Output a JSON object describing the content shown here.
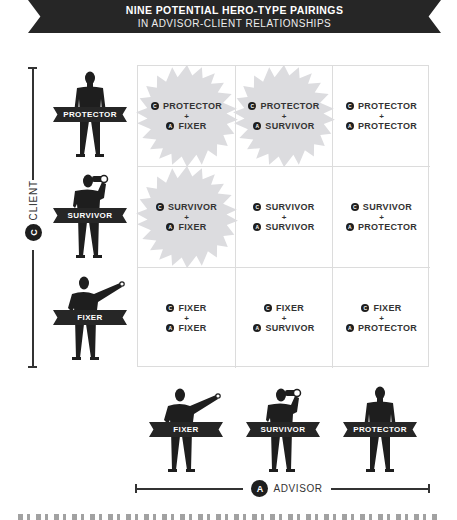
{
  "header": {
    "title": "NINE POTENTIAL HERO-TYPE PAIRINGS",
    "subtitle": "IN ADVISOR-CLIENT RELATIONSHIPS"
  },
  "axes": {
    "client": {
      "badge": "C",
      "label": "CLIENT"
    },
    "advisor": {
      "badge": "A",
      "label": "ADVISOR"
    }
  },
  "badges": {
    "client": "C",
    "advisor": "A"
  },
  "plus": "+",
  "client_figures": [
    {
      "type": "PROTECTOR",
      "pose": "standing"
    },
    {
      "type": "SURVIVOR",
      "pose": "binoculars"
    },
    {
      "type": "FIXER",
      "pose": "pointing"
    }
  ],
  "advisor_figures": [
    {
      "type": "FIXER",
      "pose": "pointing"
    },
    {
      "type": "SURVIVOR",
      "pose": "binoculars"
    },
    {
      "type": "PROTECTOR",
      "pose": "standing"
    }
  ],
  "grid": {
    "rows": [
      [
        {
          "client": "PROTECTOR",
          "advisor": "FIXER",
          "highlighted": true
        },
        {
          "client": "PROTECTOR",
          "advisor": "SURVIVOR",
          "highlighted": true
        },
        {
          "client": "PROTECTOR",
          "advisor": "PROTECTOR",
          "highlighted": false
        }
      ],
      [
        {
          "client": "SURVIVOR",
          "advisor": "FIXER",
          "highlighted": true
        },
        {
          "client": "SURVIVOR",
          "advisor": "SURVIVOR",
          "highlighted": false
        },
        {
          "client": "SURVIVOR",
          "advisor": "PROTECTOR",
          "highlighted": false
        }
      ],
      [
        {
          "client": "FIXER",
          "advisor": "FIXER",
          "highlighted": false
        },
        {
          "client": "FIXER",
          "advisor": "SURVIVOR",
          "highlighted": false
        },
        {
          "client": "FIXER",
          "advisor": "PROTECTOR",
          "highlighted": false
        }
      ]
    ]
  },
  "colors": {
    "dark": "#262626",
    "starburst": "#dcdcdf",
    "grid_line": "#dcdcdc"
  }
}
